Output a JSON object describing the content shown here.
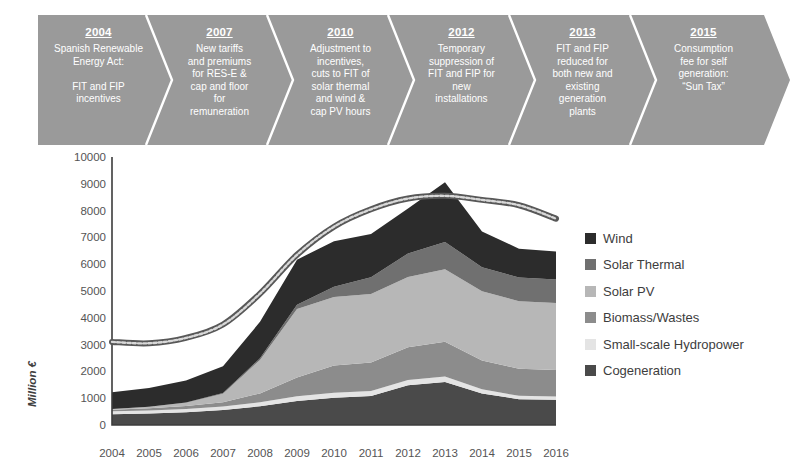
{
  "timeline": {
    "band_color": "#9a9a9a",
    "divider_color": "#ffffff",
    "items": [
      {
        "year": "2004",
        "desc": "Spanish Renewable\nEnergy Act:\n\nFIT and FIP\nincentives"
      },
      {
        "year": "2007",
        "desc": "New tariffs\nand premiums\nfor RES-E &\ncap and floor\nfor\nremuneration"
      },
      {
        "year": "2010",
        "desc": "Adjustment to\nincentives,\ncuts to FIT of\nsolar thermal\nand wind &\ncap PV hours"
      },
      {
        "year": "2012",
        "desc": "Temporary\nsuppression of\nFIT and FIP for\nnew\ninstallations"
      },
      {
        "year": "2013",
        "desc": "FIT and FIP\nreduced for\nboth new and\nexisting\ngeneration\nplants"
      },
      {
        "year": "2015",
        "desc": "Consumption\nfee for self\ngeneration:\n“Sun Tax”"
      }
    ]
  },
  "chart_data": {
    "type": "area",
    "title": "",
    "xlabel": "",
    "ylabel": "Million €",
    "ylim": [
      0,
      10000
    ],
    "ytick_step": 1000,
    "ytick_labels": [
      "0",
      "1000",
      "2000",
      "3000",
      "4000",
      "5000",
      "6000",
      "7000",
      "8000",
      "9000",
      "10000"
    ],
    "grid": false,
    "legend_position": "right",
    "stacked": true,
    "x": [
      2004,
      2005,
      2006,
      2007,
      2008,
      2009,
      2010,
      2011,
      2012,
      2013,
      2014,
      2015,
      2016
    ],
    "categories": [
      "2004",
      "2005",
      "2006",
      "2007",
      "2008",
      "2009",
      "2010",
      "2011",
      "2012",
      "2013",
      "2014",
      "2015",
      "2016"
    ],
    "series": [
      {
        "name": "Cogeneration",
        "color": "#4a4a4a",
        "stack_order": 1,
        "values": [
          400,
          430,
          480,
          560,
          700,
          900,
          1020,
          1080,
          1480,
          1600,
          1180,
          960,
          940
        ]
      },
      {
        "name": "Small-scale Hydropower",
        "color": "#e4e4e4",
        "stack_order": 2,
        "values": [
          110,
          115,
          120,
          130,
          150,
          170,
          180,
          190,
          200,
          210,
          150,
          130,
          125
        ]
      },
      {
        "name": "Biomass/Wastes",
        "color": "#8c8c8c",
        "stack_order": 3,
        "values": [
          60,
          80,
          110,
          160,
          330,
          700,
          1020,
          1060,
          1220,
          1300,
          1080,
          1010,
          990
        ]
      },
      {
        "name": "Solar PV",
        "color": "#b7b7b7",
        "stack_order": 4,
        "values": [
          30,
          60,
          120,
          320,
          1250,
          2560,
          2560,
          2560,
          2620,
          2700,
          2580,
          2520,
          2500
        ]
      },
      {
        "name": "Solar Thermal",
        "color": "#707070",
        "stack_order": 5,
        "values": [
          0,
          0,
          10,
          20,
          60,
          160,
          380,
          620,
          880,
          1020,
          900,
          880,
          870
        ]
      },
      {
        "name": "Wind",
        "color": "#2c2c2c",
        "stack_order": 6,
        "values": [
          620,
          700,
          820,
          1000,
          1360,
          1680,
          1700,
          1620,
          1680,
          2230,
          1330,
          1080,
          1050
        ]
      }
    ],
    "total_line": {
      "name": "total-trend-line",
      "color": "#585858",
      "values": [
        3100,
        3050,
        3250,
        3750,
        4900,
        6350,
        7400,
        8050,
        8450,
        8550,
        8400,
        8200,
        7700
      ]
    },
    "total_stacked": [
      1220,
      1385,
      1640,
      2190,
      3850,
      6170,
      6860,
      7130,
      8080,
      9060,
      7220,
      6580,
      6475
    ]
  },
  "legend": {
    "items": [
      {
        "label": "Wind",
        "color": "#2c2c2c"
      },
      {
        "label": "Solar Thermal",
        "color": "#707070"
      },
      {
        "label": "Solar PV",
        "color": "#b7b7b7"
      },
      {
        "label": "Biomass/Wastes",
        "color": "#8c8c8c"
      },
      {
        "label": "Small-scale Hydropower",
        "color": "#e4e4e4"
      },
      {
        "label": "Cogeneration",
        "color": "#4a4a4a"
      }
    ]
  }
}
